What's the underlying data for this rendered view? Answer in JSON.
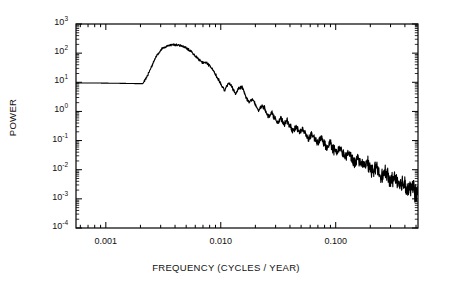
{
  "figure": {
    "name": "power-spectrum-plot",
    "background": "#ffffff",
    "line_color": "#000000",
    "axis_color": "#000000"
  },
  "axes": {
    "x_title": "FREQUENCY (CYCLES / YEAR)",
    "y_title": "POWER",
    "x_ticklabels": [
      "0.001",
      "0.010",
      "0.100"
    ],
    "x_tickvalues": [
      0.001,
      0.01,
      0.1
    ],
    "y_ticklabels": [
      "10³",
      "10²",
      "10¹",
      "10⁰",
      "10⁻¹",
      "10⁻²",
      "10⁻³",
      "10⁻⁴"
    ],
    "y_mantissas": [
      "10",
      "10",
      "10",
      "10",
      "10",
      "10",
      "10",
      "10"
    ],
    "y_exponents": [
      "3",
      "2",
      "1",
      "0",
      "-1",
      "-2",
      "-3",
      "-4"
    ],
    "y_tickvalues": [
      1000,
      100,
      10,
      1,
      0.1,
      0.01,
      0.001,
      0.0001
    ]
  },
  "chart_data": {
    "type": "line",
    "title": "",
    "subtitle": "",
    "xlabel": "FREQUENCY (CYCLES / YEAR)",
    "ylabel": "POWER",
    "xscale": "log",
    "yscale": "log",
    "xlim": [
      0.00055,
      0.52
    ],
    "ylim": [
      0.0001,
      1000
    ],
    "grid": false,
    "legend": null,
    "annotations": [],
    "x_ticks": [
      0.001,
      0.01,
      0.1
    ],
    "x_ticklabels": [
      "0.001",
      "0.010",
      "0.100"
    ],
    "y_ticks": [
      0.0001,
      0.001,
      0.01,
      0.1,
      1,
      10,
      100,
      1000
    ],
    "y_ticklabels": [
      "10^-4",
      "10^-3",
      "10^-2",
      "10^-1",
      "10^0",
      "10^1",
      "10^2",
      "10^3"
    ],
    "series": [
      {
        "name": "power spectral density",
        "color": "#000000",
        "linewidth": 1.1,
        "x": [
          0.00072,
          0.0009,
          0.0011,
          0.00135,
          0.0016,
          0.00185,
          0.0021,
          0.00235,
          0.0027,
          0.0031,
          0.0035,
          0.004,
          0.0045,
          0.005,
          0.0056,
          0.0062,
          0.0069,
          0.0076,
          0.0084,
          0.0092,
          0.01,
          0.0108,
          0.0116,
          0.0125,
          0.0134,
          0.0144,
          0.0154,
          0.0165,
          0.0176,
          0.0188,
          0.02,
          0.0214,
          0.0228,
          0.0243,
          0.0259,
          0.0276,
          0.0294,
          0.0313,
          0.0333,
          0.0355,
          0.0378,
          0.0402,
          0.0428,
          0.0456,
          0.0485,
          0.0516,
          0.0549,
          0.0584,
          0.0621,
          0.0661,
          0.0703,
          0.0748,
          0.0795,
          0.0846,
          0.09,
          0.0957,
          0.1018,
          0.1082,
          0.1151,
          0.1224,
          0.1302,
          0.1384,
          0.1472,
          0.1565,
          0.1664,
          0.177,
          0.1882,
          0.2001,
          0.2128,
          0.2263,
          0.2406,
          0.2558,
          0.272,
          0.2892,
          0.3075,
          0.3269,
          0.3476,
          0.3696,
          0.393,
          0.4179,
          0.4443,
          0.4724,
          0.5
        ],
        "y": [
          9.5,
          9.4,
          9.3,
          9.2,
          9.1,
          9.0,
          9.0,
          20.0,
          70.0,
          150.0,
          185.0,
          195.0,
          180.0,
          150.0,
          110.0,
          70.0,
          48.0,
          45.0,
          30.0,
          16.0,
          9.0,
          5.0,
          9.5,
          7.0,
          4.0,
          6.5,
          7.0,
          3.2,
          2.1,
          2.6,
          1.7,
          1.05,
          1.6,
          1.25,
          0.62,
          0.95,
          0.6,
          0.4,
          0.58,
          0.36,
          0.5,
          0.3,
          0.21,
          0.3,
          0.19,
          0.26,
          0.155,
          0.115,
          0.175,
          0.105,
          0.082,
          0.125,
          0.075,
          0.056,
          0.088,
          0.05,
          0.038,
          0.058,
          0.035,
          0.026,
          0.04,
          0.024,
          0.018,
          0.027,
          0.016,
          0.0125,
          0.0185,
          0.011,
          0.0086,
          0.0125,
          0.0076,
          0.006,
          0.0086,
          0.0052,
          0.0042,
          0.0058,
          0.0036,
          0.0029,
          0.0039,
          0.0025,
          0.002,
          0.0026,
          0.0013
        ],
        "description": "Red-noise power spectrum: flat low-frequency plateau near 9, broad peak ~195 at 0.004 cycles/year, then steep noisy power-law decay to ~1e-3 at 0.5 cycles/year with oscillation density increasing toward high frequency."
      }
    ]
  }
}
